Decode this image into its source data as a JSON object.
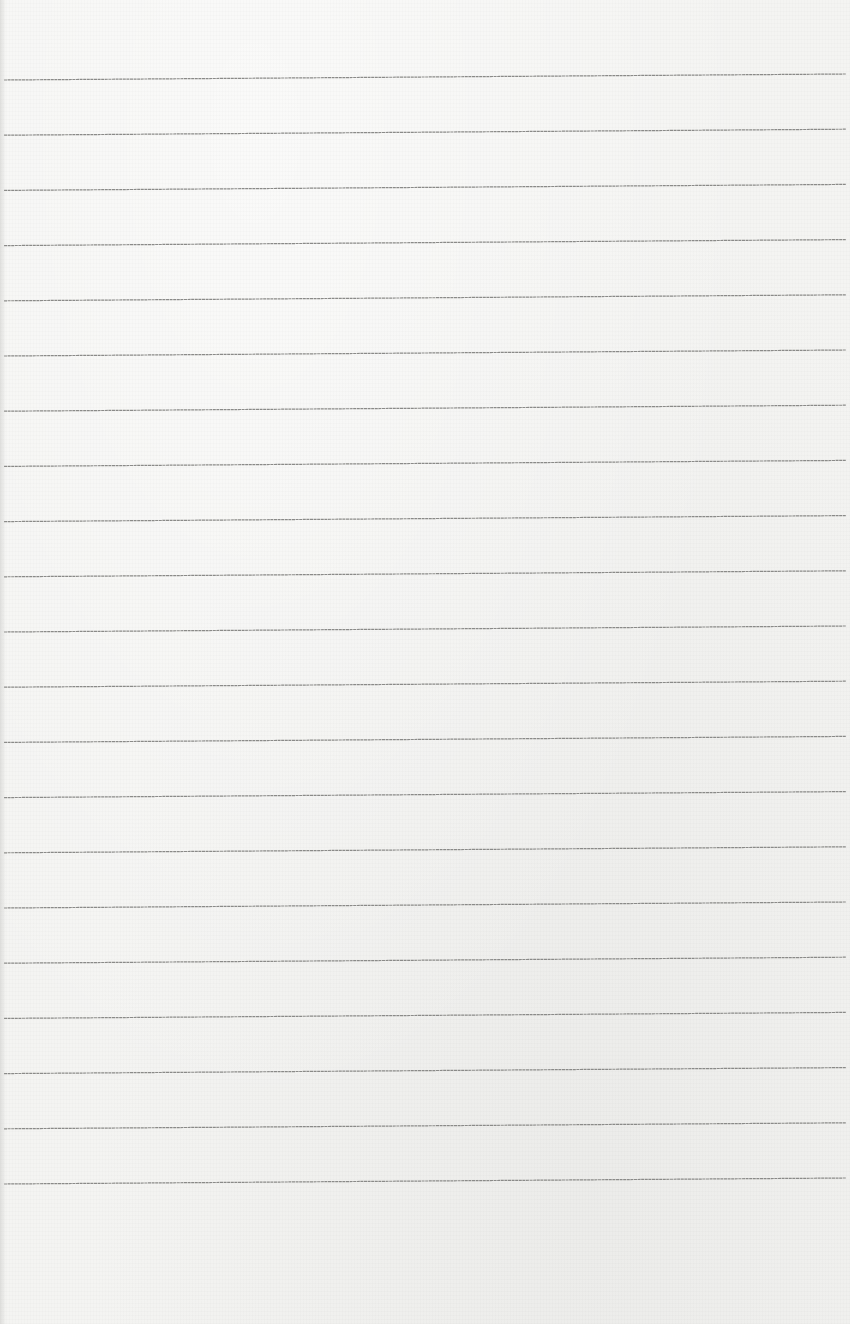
{
  "page": {
    "type": "lined-paper",
    "background_color": "#f4f4f2",
    "line_color": "#8a8a88",
    "line_count": 21,
    "line_spacing_px": 55.2,
    "first_line_left_y": 80,
    "first_line_right_y": 74,
    "line_left_x": 4,
    "line_right_x": 846,
    "handwriting": ""
  }
}
